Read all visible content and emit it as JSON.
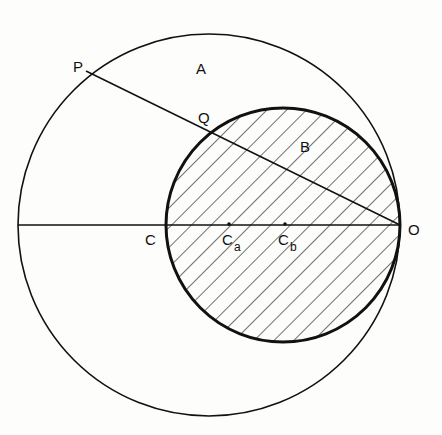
{
  "diagram": {
    "type": "geometric-construction",
    "labels": {
      "P": "P",
      "A": "A",
      "Q": "Q",
      "B": "B",
      "C": "C",
      "Ca_main": "C",
      "Ca_sub": "a",
      "Cb_main": "C",
      "Cb_sub": "b",
      "O": "O"
    },
    "large_circle": {
      "cx": 209,
      "cy": 225,
      "r": 191,
      "region_label": "A"
    },
    "small_circle": {
      "cx": 283,
      "cy": 225,
      "r": 117,
      "region_label": "B",
      "fill": "hatched"
    },
    "lines": [
      {
        "name": "diameter-C-O",
        "from": [
          18,
          225
        ],
        "to": [
          400,
          225
        ]
      },
      {
        "name": "chord-P-O",
        "from": [
          86,
          78
        ],
        "to": [
          400,
          225
        ]
      }
    ],
    "points": {
      "Ca": [
        229,
        225
      ],
      "Cb": [
        285,
        225
      ]
    },
    "colors": {
      "stroke": "#111111",
      "background": "#fdfdfc"
    }
  }
}
